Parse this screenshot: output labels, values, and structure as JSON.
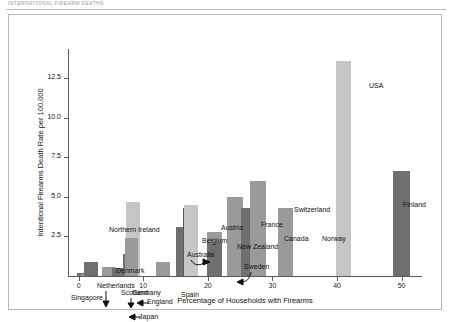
{
  "header": {
    "cropped_text": "INTERNATIONAL FIREARM DEATHS"
  },
  "chart_data": {
    "type": "bar",
    "title": "",
    "xlabel": "Percentage of Households with Firearms",
    "ylabel": "Intentional Firearms Death Rate per 100,000",
    "xlim": [
      -1.5,
      53
    ],
    "ylim": [
      0,
      14.2
    ],
    "xticks": [
      0,
      10,
      20,
      30,
      40,
      50
    ],
    "yticks": [
      2.5,
      5.0,
      7.5,
      10.0,
      12.5
    ],
    "ytick_labels": [
      "2.5",
      "5.0",
      "7.5",
      "10.0",
      "12.5"
    ],
    "xtick_labels": [
      "0",
      "10",
      "20",
      "30",
      "40",
      "50"
    ],
    "grid": false,
    "legend": null,
    "points": [
      {
        "label": "Singapore",
        "x": 0.4,
        "value": 0.2,
        "shade": "bd",
        "width": 1.2
      },
      {
        "label": "Japan",
        "x": 0.9,
        "value": 0.1,
        "shade": "bm",
        "width": 1.2
      },
      {
        "label": "Netherlands",
        "x": 1.9,
        "value": 0.9,
        "shade": "bd",
        "width": 2.2
      },
      {
        "label": "Scotland",
        "x": 4.7,
        "value": 0.6,
        "shade": "bm",
        "width": 2.2
      },
      {
        "label": "England",
        "x": 6.2,
        "value": 0.5,
        "shade": "bd",
        "width": 2.2
      },
      {
        "label": "Germany",
        "x": 8.0,
        "value": 1.4,
        "shade": "bd",
        "width": 2.2
      },
      {
        "label": "Northern Ireland",
        "x": 8.4,
        "value": 4.7,
        "shade": "bl",
        "width": 2.2
      },
      {
        "label": "Denmark",
        "x": 8.2,
        "value": 2.4,
        "shade": "bm",
        "width": 2.0
      },
      {
        "label": "Spain",
        "x": 13.1,
        "value": 0.9,
        "shade": "bm",
        "width": 2.2
      },
      {
        "label": "Australia",
        "x": 16.0,
        "value": 3.1,
        "shade": "bd",
        "width": 2.0
      },
      {
        "label": "Belgium",
        "x": 17.2,
        "value": 4.3,
        "shade": "bxd",
        "width": 2.0
      },
      {
        "label": "Austria",
        "x": 17.4,
        "value": 4.5,
        "shade": "bl",
        "width": 2.2
      },
      {
        "label": "New Zealand",
        "x": 21.0,
        "value": 2.8,
        "shade": "bm",
        "width": 2.4
      },
      {
        "label": "Sweden",
        "x": 21.0,
        "value": 2.1,
        "shade": "bd",
        "width": 2.4
      },
      {
        "label": "France",
        "x": 24.2,
        "value": 5.0,
        "shade": "bm",
        "width": 2.4
      },
      {
        "label": "Canada",
        "x": 26.3,
        "value": 4.3,
        "shade": "bd",
        "width": 2.4
      },
      {
        "label": "Switzerland",
        "x": 27.8,
        "value": 6.0,
        "shade": "bm",
        "width": 2.4
      },
      {
        "label": "Norway",
        "x": 32.0,
        "value": 4.3,
        "shade": "bm",
        "width": 2.4
      },
      {
        "label": "USA",
        "x": 41.0,
        "value": 13.6,
        "shade": "bl",
        "width": 2.4
      },
      {
        "label": "Finland",
        "x": 50.0,
        "value": 6.6,
        "shade": "bd",
        "width": 2.6
      }
    ],
    "annotations": [
      {
        "text": "Netherlands",
        "kind": "arrow-down"
      },
      {
        "text": "Scotland",
        "kind": "arrow-down"
      },
      {
        "text": "England",
        "kind": "arrow-left"
      },
      {
        "text": "Japan",
        "kind": "arrow-left"
      },
      {
        "text": "Australia",
        "kind": "arrow-curve-right"
      },
      {
        "text": "Sweden",
        "kind": "arrow-curve-down"
      }
    ],
    "colors": {
      "light": "#c6c6c6",
      "medium": "#9a9a9a",
      "dark": "#6f6f6f",
      "extra_dark": "#585858",
      "axis": "#5a5a5a",
      "text": "#111111",
      "frame": "#b5b5b5"
    }
  }
}
